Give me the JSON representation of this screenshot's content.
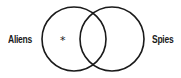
{
  "diagram": {
    "type": "venn",
    "sets": [
      {
        "label": "Aliens",
        "cx": 74,
        "cy": 39,
        "r": 32
      },
      {
        "label": "Spies",
        "cx": 112,
        "cy": 39,
        "r": 32
      }
    ],
    "marker": {
      "symbol": "*",
      "region": "Aliens only"
    },
    "stroke_color": "#1a1a1a",
    "background": "#ffffff"
  }
}
